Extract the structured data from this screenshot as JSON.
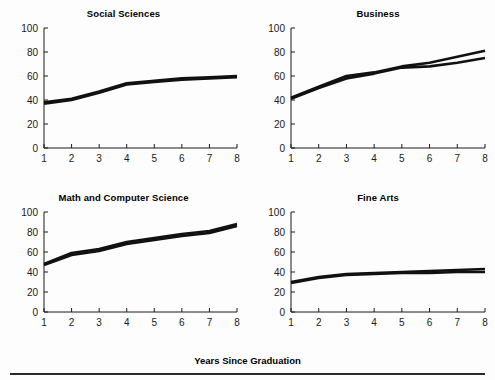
{
  "figure": {
    "xlabel": "Years Since Graduation",
    "divider": "horizontal-rule"
  },
  "chart_data": [
    {
      "type": "line",
      "title": "Social Sciences",
      "xlabel": "Years Since Graduation",
      "ylabel": "",
      "x": [
        1,
        2,
        3,
        4,
        5,
        6,
        7,
        8
      ],
      "xlim": [
        1,
        8
      ],
      "ylim": [
        0,
        100
      ],
      "xticks": [
        1,
        2,
        3,
        4,
        5,
        6,
        7,
        8
      ],
      "yticks": [
        0,
        20,
        40,
        60,
        80,
        100
      ],
      "grid": false,
      "legend": "none",
      "series": [
        {
          "name": "Series 1",
          "values": [
            38,
            41,
            47,
            54,
            56,
            58,
            59,
            60
          ]
        },
        {
          "name": "Series 2",
          "values": [
            37,
            40,
            46,
            53,
            55,
            57,
            58,
            59
          ]
        }
      ]
    },
    {
      "type": "line",
      "title": "Business",
      "xlabel": "Years Since Graduation",
      "ylabel": "",
      "x": [
        1,
        2,
        3,
        4,
        5,
        6,
        7,
        8
      ],
      "xlim": [
        1,
        8
      ],
      "ylim": [
        0,
        100
      ],
      "xticks": [
        1,
        2,
        3,
        4,
        5,
        6,
        7,
        8
      ],
      "yticks": [
        0,
        20,
        40,
        60,
        80,
        100
      ],
      "grid": false,
      "legend": "none",
      "series": [
        {
          "name": "Series 1",
          "values": [
            42,
            51,
            60,
            63,
            68,
            71,
            76,
            81
          ]
        },
        {
          "name": "Series 2",
          "values": [
            41,
            50,
            58,
            62,
            67,
            68,
            71,
            75
          ]
        }
      ]
    },
    {
      "type": "line",
      "title": "Math and Computer Science",
      "xlabel": "Years Since Graduation",
      "ylabel": "",
      "x": [
        1,
        2,
        3,
        4,
        5,
        6,
        7,
        8
      ],
      "xlim": [
        1,
        8
      ],
      "ylim": [
        0,
        100
      ],
      "xticks": [
        1,
        2,
        3,
        4,
        5,
        6,
        7,
        8
      ],
      "yticks": [
        0,
        20,
        40,
        60,
        80,
        100
      ],
      "grid": false,
      "legend": "none",
      "series": [
        {
          "name": "Series 1",
          "values": [
            48,
            59,
            63,
            70,
            74,
            78,
            81,
            88
          ]
        },
        {
          "name": "Series 2",
          "values": [
            47,
            57,
            61,
            68,
            72,
            76,
            79,
            86
          ]
        }
      ]
    },
    {
      "type": "line",
      "title": "Fine Arts",
      "xlabel": "Years Since Graduation",
      "ylabel": "",
      "x": [
        1,
        2,
        3,
        4,
        5,
        6,
        7,
        8
      ],
      "xlim": [
        1,
        8
      ],
      "ylim": [
        0,
        100
      ],
      "xticks": [
        1,
        2,
        3,
        4,
        5,
        6,
        7,
        8
      ],
      "yticks": [
        0,
        20,
        40,
        60,
        80,
        100
      ],
      "grid": false,
      "legend": "none",
      "series": [
        {
          "name": "Series 1",
          "values": [
            30,
            35,
            38,
            39,
            40,
            41,
            42,
            43
          ]
        },
        {
          "name": "Series 2",
          "values": [
            29,
            34,
            37,
            38,
            39,
            39,
            40,
            40
          ]
        }
      ]
    }
  ]
}
